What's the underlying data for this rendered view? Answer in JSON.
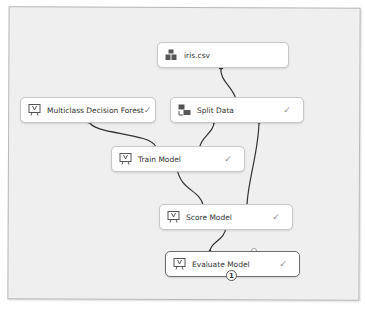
{
  "canvas": {
    "background": "#efefef",
    "node_background": "#ffffff",
    "wire_color": "#333333"
  },
  "nodes": {
    "iris": {
      "label": "iris.csv",
      "icon": "dataset-icon",
      "status": ""
    },
    "forest": {
      "label": "Multiclass Decision Forest",
      "icon": "module-icon",
      "status": "✓"
    },
    "split": {
      "label": "Split Data",
      "icon": "split-data-icon",
      "status": "✓"
    },
    "train": {
      "label": "Train Model",
      "icon": "module-icon",
      "status": "✓"
    },
    "score": {
      "label": "Score Model",
      "icon": "module-icon",
      "status": "✓"
    },
    "evaluate": {
      "label": "Evaluate Model",
      "icon": "module-icon",
      "status": "✓",
      "badge": "1"
    }
  },
  "connections": [
    {
      "from": "iris.csv",
      "to": "Split Data"
    },
    {
      "from": "Multiclass Decision Forest",
      "to": "Train Model"
    },
    {
      "from": "Split Data (left output)",
      "to": "Train Model"
    },
    {
      "from": "Split Data (right output)",
      "to": "Score Model"
    },
    {
      "from": "Train Model",
      "to": "Score Model"
    },
    {
      "from": "Score Model",
      "to": "Evaluate Model"
    }
  ]
}
